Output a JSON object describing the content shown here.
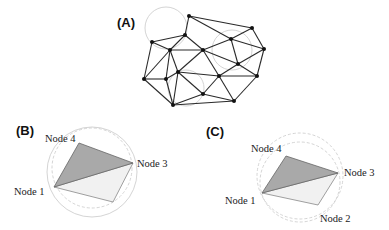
{
  "figure": {
    "panels": [
      {
        "id": "A",
        "label": "(A)",
        "description": "Delaunay triangulation mesh with empty circumcircles",
        "nodes": [
          [
            189,
            16
          ],
          [
            252,
            28
          ],
          [
            185,
            35
          ],
          [
            231,
            39
          ],
          [
            152,
            42
          ],
          [
            170,
            50
          ],
          [
            203,
            50
          ],
          [
            264,
            49
          ],
          [
            238,
            64
          ],
          [
            178,
            72
          ],
          [
            219,
            76
          ],
          [
            257,
            76
          ],
          [
            144,
            79
          ],
          [
            166,
            79
          ],
          [
            203,
            94
          ],
          [
            234,
            101
          ],
          [
            173,
            105
          ]
        ],
        "edges": [
          [
            0,
            1
          ],
          [
            0,
            2
          ],
          [
            0,
            3
          ],
          [
            1,
            3
          ],
          [
            1,
            7
          ],
          [
            3,
            7
          ],
          [
            2,
            4
          ],
          [
            2,
            5
          ],
          [
            2,
            6
          ],
          [
            4,
            5
          ],
          [
            5,
            6
          ],
          [
            6,
            3
          ],
          [
            6,
            8
          ],
          [
            3,
            8
          ],
          [
            7,
            8
          ],
          [
            4,
            12
          ],
          [
            5,
            12
          ],
          [
            5,
            13
          ],
          [
            5,
            9
          ],
          [
            6,
            9
          ],
          [
            6,
            10
          ],
          [
            12,
            13
          ],
          [
            13,
            9
          ],
          [
            9,
            10
          ],
          [
            9,
            14
          ],
          [
            9,
            16
          ],
          [
            13,
            16
          ],
          [
            12,
            16
          ],
          [
            16,
            14
          ],
          [
            16,
            15
          ],
          [
            14,
            10
          ],
          [
            14,
            15
          ],
          [
            10,
            8
          ],
          [
            10,
            15
          ],
          [
            8,
            11
          ],
          [
            11,
            15
          ],
          [
            7,
            11
          ],
          [
            10,
            11
          ]
        ],
        "circles": [
          {
            "cx": 166,
            "cy": 28,
            "r": 21
          },
          {
            "cx": 232,
            "cy": 50,
            "r": 20
          },
          {
            "cx": 186,
            "cy": 88,
            "r": 18
          }
        ]
      },
      {
        "id": "B",
        "label": "(B)",
        "nodes": {
          "node1": {
            "label": "Node 1",
            "x": 54,
            "y": 187
          },
          "node2": {
            "x": 113,
            "y": 202
          },
          "node3": {
            "label": "Node 3",
            "x": 133,
            "y": 163
          },
          "node4": {
            "label": "Node 4",
            "x": 79,
            "y": 143
          }
        },
        "shaded_triangle": [
          "node1",
          "node4",
          "node3"
        ],
        "light_triangle": [
          "node1",
          "node3",
          "node2"
        ],
        "circles": [
          {
            "cx": 92,
            "cy": 172,
            "r": 45,
            "style": "solid"
          },
          {
            "cx": 92,
            "cy": 168,
            "r": 40,
            "style": "dashed"
          }
        ]
      },
      {
        "id": "C",
        "label": "(C)",
        "nodes": {
          "node1": {
            "label": "Node 1",
            "x": 262,
            "y": 193
          },
          "node2": {
            "label": "Node 2",
            "x": 318,
            "y": 205
          },
          "node3": {
            "label": "Node 3",
            "x": 338,
            "y": 173
          },
          "node4": {
            "label": "Node 4",
            "x": 286,
            "y": 156
          }
        },
        "shaded_triangle": [
          "node1",
          "node4",
          "node3"
        ],
        "light_triangle": [
          "node1",
          "node3",
          "node2"
        ],
        "circles": [
          {
            "cx": 300,
            "cy": 176,
            "r": 43,
            "style": "dashed"
          },
          {
            "cx": 300,
            "cy": 182,
            "r": 40,
            "style": "dashed"
          }
        ]
      }
    ],
    "colors": {
      "shaded_fill": "#a9a9a9",
      "light_fill": "#f1f1f1",
      "circle_stroke": "#cfcfcf",
      "edge_stroke": "#2a2a2a"
    }
  }
}
